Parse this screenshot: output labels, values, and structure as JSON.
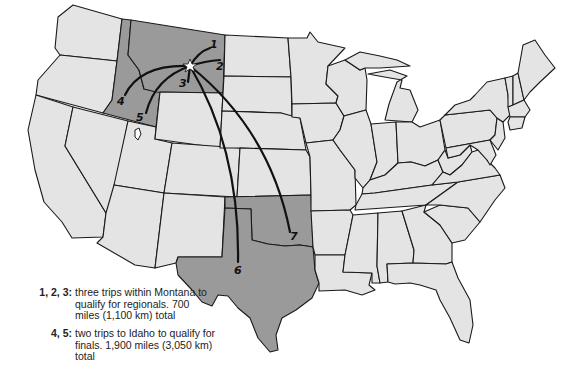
{
  "map": {
    "title": "Trips to qualify (United States map)",
    "highlighted_states": [
      "Montana",
      "Idaho",
      "Texas",
      "Oklahoma"
    ],
    "colors": {
      "state_fill": "#e4e4e4",
      "highlight_fill": "#9a9a9a",
      "border": "#1a1a1a",
      "route": "#111111",
      "background": "#ffffff"
    },
    "origin_marker": "star-icon",
    "route_labels": [
      "1",
      "2",
      "3",
      "4",
      "5",
      "6",
      "7"
    ]
  },
  "legend": [
    {
      "key": "1, 2, 3:",
      "text": "three trips within Montana to qualify for regionals. 700 miles (1,100 km) total"
    },
    {
      "key": "4, 5:",
      "text": "two trips to Idaho to qualify for finals. 1,900 miles (3,050 km) total"
    }
  ]
}
